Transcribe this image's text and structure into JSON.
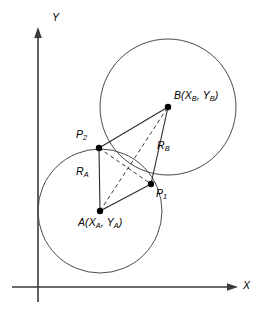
{
  "figure": {
    "type": "geometry-diagram",
    "background_color": "#ffffff",
    "line_color": "#2a2a2a",
    "axes": {
      "x_label": "X",
      "y_label": "Y",
      "origin": {
        "x": 38,
        "y": 287
      },
      "x_end": {
        "x": 238,
        "y": 287
      },
      "y_end": {
        "x": 38,
        "y": 30
      }
    },
    "circles": [
      {
        "name": "circle-a",
        "center_label": "A",
        "cx": 100,
        "cy": 211,
        "r": 62,
        "radius_label": "R",
        "radius_subscript": "A"
      },
      {
        "name": "circle-b",
        "center_label": "B",
        "cx": 168,
        "cy": 107,
        "r": 68,
        "radius_label": "R",
        "radius_subscript": "B"
      }
    ],
    "points": [
      {
        "name": "center-a",
        "label": "A",
        "coord_text": "(X",
        "sub1": "A",
        "mid": ", Y",
        "sub2": "A",
        "close": ")",
        "x": 100,
        "y": 211
      },
      {
        "name": "center-b",
        "label": "B",
        "coord_text": "(X",
        "sub1": "B",
        "mid": ", Y",
        "sub2": "B",
        "close": ")",
        "x": 168,
        "y": 107
      },
      {
        "name": "intersection-p1",
        "label": "P",
        "subscript": "1",
        "x": 151,
        "y": 184
      },
      {
        "name": "intersection-p2",
        "label": "P",
        "subscript": "2",
        "x": 99,
        "y": 148
      }
    ],
    "segments": [
      {
        "name": "segment-a-p2",
        "style": "solid",
        "from": "A",
        "to": "P2"
      },
      {
        "name": "segment-a-p1",
        "style": "solid",
        "from": "A",
        "to": "P1"
      },
      {
        "name": "segment-b-p2",
        "style": "solid",
        "from": "B",
        "to": "P2"
      },
      {
        "name": "segment-b-p1",
        "style": "solid",
        "from": "B",
        "to": "P1"
      },
      {
        "name": "segment-a-b",
        "style": "dashed",
        "from": "A",
        "to": "B"
      },
      {
        "name": "segment-p1-p2",
        "style": "dashed",
        "from": "P2",
        "to": "P1"
      }
    ],
    "labels": {
      "y_axis": "Y",
      "x_axis": "X",
      "point_b_prefix": "B(X",
      "point_b_sub1": "B",
      "point_b_mid": ", Y",
      "point_b_sub2": "B",
      "point_b_close": ")",
      "point_a_prefix": "A(X",
      "point_a_sub1": "A",
      "point_a_mid": ", Y",
      "point_a_sub2": "A",
      "point_a_close": ")",
      "p2_main": "P",
      "p2_sub": "2",
      "p1_main": "P",
      "p1_sub": "1",
      "ra_main": "R",
      "ra_sub": "A",
      "rb_main": "R",
      "rb_sub": "B"
    }
  }
}
